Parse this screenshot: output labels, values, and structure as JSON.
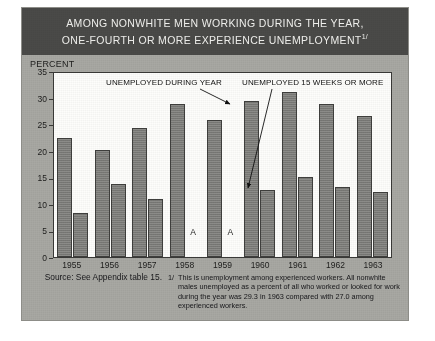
{
  "title": {
    "line1": "AMONG NONWHITE MEN WORKING DURING THE YEAR,",
    "line2": "ONE-FOURTH OR MORE EXPERIENCE UNEMPLOYMENT",
    "footnote_marker": "1/"
  },
  "axis": {
    "y_label": "PERCENT",
    "y_ticks": [
      "35",
      "30",
      "25",
      "20",
      "15",
      "10",
      "5",
      "0"
    ]
  },
  "annotations": {
    "series1": "UNEMPLOYED DURING YEAR",
    "series2": "UNEMPLOYED 15 WEEKS OR MORE"
  },
  "na_marker": "A",
  "footnote": {
    "source": "Source: See Appendix table 15.",
    "marker": "1/",
    "text": "This is unemployment among experienced workers. All nonwhite males unemployed as a percent of all who worked or looked for work during the year was 29.3 in 1963 compared with 27.0 among experienced workers."
  },
  "colors": {
    "panel": "#a8a8a3",
    "title_bar": "#4a4a48",
    "bar_fill": "#7f7f7c",
    "bar_stroke": "#3f3f3d",
    "plot_bg": "#fdfdfb"
  },
  "chart_data": {
    "type": "bar",
    "title": "AMONG NONWHITE MEN WORKING DURING THE YEAR, ONE-FOURTH OR MORE EXPERIENCE UNEMPLOYMENT",
    "xlabel": "",
    "ylabel": "PERCENT",
    "ylim": [
      0,
      35
    ],
    "ytick_step": 5,
    "grid": false,
    "legend": "annotated-arrows",
    "categories": [
      "1955",
      "1956",
      "1957",
      "1958",
      "1959",
      "1960",
      "1961",
      "1962",
      "1963"
    ],
    "series": [
      {
        "name": "UNEMPLOYED DURING YEAR",
        "values": [
          22.4,
          20.2,
          24.3,
          28.7,
          25.7,
          29.3,
          31.0,
          28.8,
          26.5
        ]
      },
      {
        "name": "UNEMPLOYED 15 WEEKS OR MORE",
        "values": [
          8.2,
          13.7,
          11.0,
          null,
          null,
          12.6,
          15.0,
          13.2,
          12.3
        ],
        "missing_marker": "A",
        "missing_categories": [
          "1958",
          "1959"
        ]
      }
    ]
  }
}
